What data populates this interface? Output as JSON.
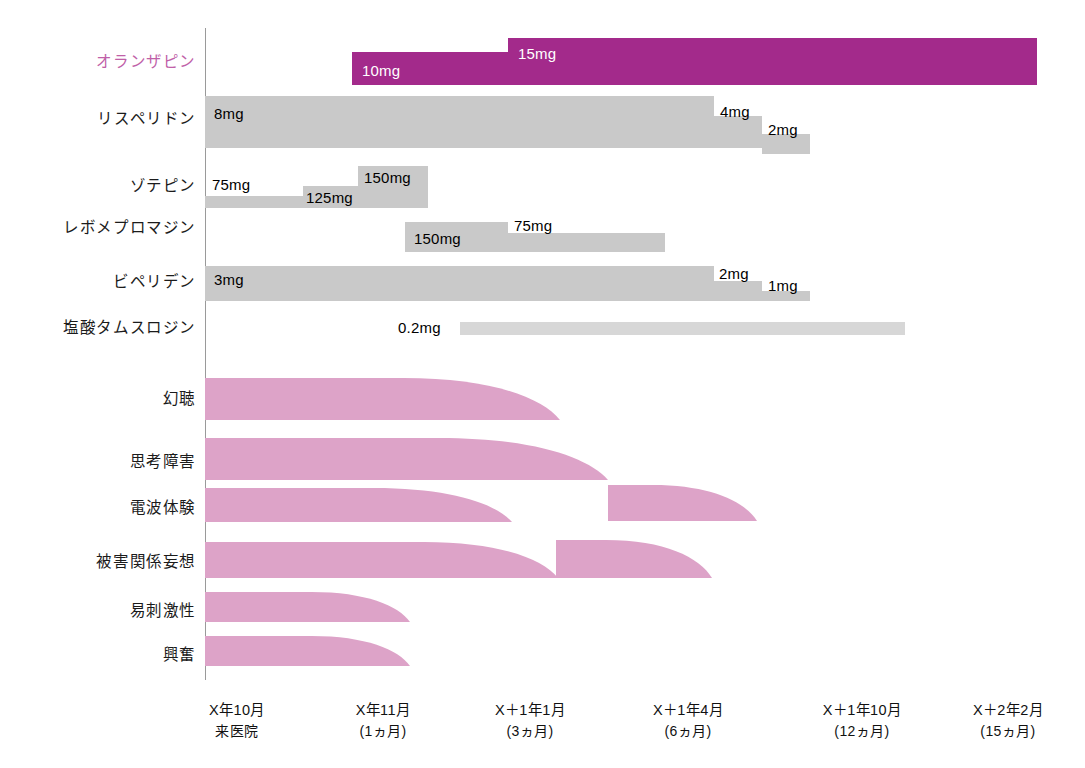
{
  "chart_data": {
    "type": "timeline",
    "title": "",
    "xlabel": "",
    "ylabel": "",
    "axis": {
      "x_origin_px": 205,
      "x_end_px": 1060,
      "grid": false,
      "legend": "none"
    },
    "x_ticks": [
      {
        "label": "X年10月",
        "sub": "来医院",
        "x": 237
      },
      {
        "label": "X年11月",
        "sub": "(1ヵ月)",
        "x": 383
      },
      {
        "label": "X＋1年1月",
        "sub": "(3ヵ月)",
        "x": 530
      },
      {
        "label": "X＋1年4月",
        "sub": "(6ヵ月)",
        "x": 688
      },
      {
        "label": "X＋1年10月",
        "sub": "(12ヵ月)",
        "x": 862
      },
      {
        "label": "X＋2年2月",
        "sub": "(15ヵ月)",
        "x": 1008
      }
    ],
    "medications": [
      {
        "name": "オランザピン",
        "accent": true,
        "label_y": 62,
        "segments": [
          {
            "dose": "10mg",
            "x": 352,
            "w": 156,
            "y": 52,
            "h": 33,
            "color": "magenta",
            "label_on_dark": true,
            "label_x": 362,
            "label_y": 63
          },
          {
            "dose": "15mg",
            "x": 508,
            "w": 529,
            "y": 38,
            "h": 47,
            "color": "magenta",
            "label_on_dark": true,
            "label_x": 518,
            "label_y": 46
          }
        ]
      },
      {
        "name": "リスペリドン",
        "accent": false,
        "label_y": 119,
        "segments": [
          {
            "dose": "8mg",
            "x": 205,
            "w": 509,
            "y": 96,
            "h": 52,
            "color": "gray",
            "label_on_dark": false,
            "label_x": 214,
            "label_y": 106
          },
          {
            "dose": "4mg",
            "x": 714,
            "w": 48,
            "y": 116,
            "h": 32,
            "color": "gray",
            "label_on_dark": false,
            "label_x": 720,
            "label_y": 104
          },
          {
            "dose": "2mg",
            "x": 762,
            "w": 48,
            "y": 134,
            "h": 20,
            "color": "gray",
            "label_on_dark": false,
            "label_x": 768,
            "label_y": 122
          }
        ]
      },
      {
        "name": "ゾテピン",
        "accent": false,
        "label_y": 186,
        "segments": [
          {
            "dose": "75mg",
            "x": 205,
            "w": 98,
            "y": 196,
            "h": 12,
            "color": "gray",
            "label_on_dark": false,
            "label_x": 212,
            "label_y": 177
          },
          {
            "dose": "125mg",
            "x": 303,
            "w": 55,
            "y": 186,
            "h": 22,
            "color": "gray",
            "label_on_dark": false,
            "label_x": 306,
            "label_y": 190
          },
          {
            "dose": "150mg",
            "x": 358,
            "w": 70,
            "y": 166,
            "h": 42,
            "color": "gray",
            "label_on_dark": false,
            "label_x": 364,
            "label_y": 170
          }
        ]
      },
      {
        "name": "レボメプロマジン",
        "accent": false,
        "label_y": 228,
        "segments": [
          {
            "dose": "150mg",
            "x": 405,
            "w": 103,
            "y": 222,
            "h": 30,
            "color": "gray",
            "label_on_dark": false,
            "label_x": 414,
            "label_y": 231
          },
          {
            "dose": "75mg",
            "x": 508,
            "w": 157,
            "y": 233,
            "h": 19,
            "color": "gray",
            "label_on_dark": false,
            "label_x": 514,
            "label_y": 218
          }
        ]
      },
      {
        "name": "ビペリデン",
        "accent": false,
        "label_y": 282,
        "segments": [
          {
            "dose": "3mg",
            "x": 205,
            "w": 509,
            "y": 266,
            "h": 35,
            "color": "gray",
            "label_on_dark": false,
            "label_x": 214,
            "label_y": 272
          },
          {
            "dose": "2mg",
            "x": 714,
            "w": 48,
            "y": 281,
            "h": 20,
            "color": "gray",
            "label_on_dark": false,
            "label_x": 719,
            "label_y": 266
          },
          {
            "dose": "1mg",
            "x": 762,
            "w": 48,
            "y": 291,
            "h": 10,
            "color": "gray",
            "label_on_dark": false,
            "label_x": 768,
            "label_y": 278
          }
        ]
      },
      {
        "name": "塩酸タムスロジン",
        "accent": false,
        "label_y": 328,
        "segments": [
          {
            "dose": "0.2mg",
            "x": 460,
            "w": 445,
            "y": 322,
            "h": 13,
            "color": "light",
            "label_on_dark": false,
            "label_x": 398,
            "label_y": 320
          }
        ]
      }
    ],
    "symptoms": [
      {
        "name": "幻聴",
        "label_y": 399,
        "lobes": [
          {
            "x0": 205,
            "x1": 560,
            "y_top": 378,
            "y_bot": 420,
            "taper": 0.56
          }
        ]
      },
      {
        "name": "思考障害",
        "label_y": 462,
        "lobes": [
          {
            "x0": 205,
            "x1": 608,
            "y_top": 438,
            "y_bot": 480,
            "taper": 0.58
          }
        ]
      },
      {
        "name": "電波体験",
        "label_y": 508,
        "lobes": [
          {
            "x0": 205,
            "x1": 512,
            "y_top": 488,
            "y_bot": 522,
            "taper": 0.55
          },
          {
            "x0": 608,
            "x1": 757,
            "y_top": 485,
            "y_bot": 521,
            "taper": 0.3
          }
        ]
      },
      {
        "name": "被害関係妄想",
        "label_y": 562,
        "lobes": [
          {
            "x0": 205,
            "x1": 558,
            "y_top": 542,
            "y_bot": 578,
            "taper": 0.62
          },
          {
            "x0": 556,
            "x1": 712,
            "y_top": 540,
            "y_bot": 578,
            "taper": 0.32
          }
        ]
      },
      {
        "name": "易刺激性",
        "label_y": 611,
        "lobes": [
          {
            "x0": 205,
            "x1": 410,
            "y_top": 592,
            "y_bot": 622,
            "taper": 0.52
          }
        ]
      },
      {
        "name": "興奮",
        "label_y": 655,
        "lobes": [
          {
            "x0": 205,
            "x1": 410,
            "y_top": 636,
            "y_bot": 666,
            "taper": 0.52
          }
        ]
      }
    ],
    "colors": {
      "accent_magenta": "#a32a8b",
      "bar_gray": "#c9c9c9",
      "bar_light_gray": "#d7d7d7",
      "symptom_pink": "#dda3c8",
      "axis_gray": "#9a9a9a",
      "text_black": "#1b1b1b",
      "accent_label": "#c060a8"
    }
  }
}
